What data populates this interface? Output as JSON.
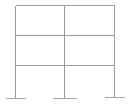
{
  "diagram": {
    "type": "structural-frame",
    "bays": 2,
    "stories": 3,
    "colors": {
      "member": "#9a9a9a",
      "support": "#a8a8a8",
      "background": "#ffffff"
    },
    "columns_x": [
      15,
      64,
      114
    ],
    "levels_y": [
      5,
      35,
      65
    ],
    "base_y": [
      98,
      98,
      97
    ],
    "supports": [
      {
        "x": 15,
        "y": 98,
        "half_width": 10
      },
      {
        "x": 64,
        "y": 98,
        "half_width": 12
      },
      {
        "x": 114,
        "y": 97,
        "half_width": 10
      }
    ]
  }
}
